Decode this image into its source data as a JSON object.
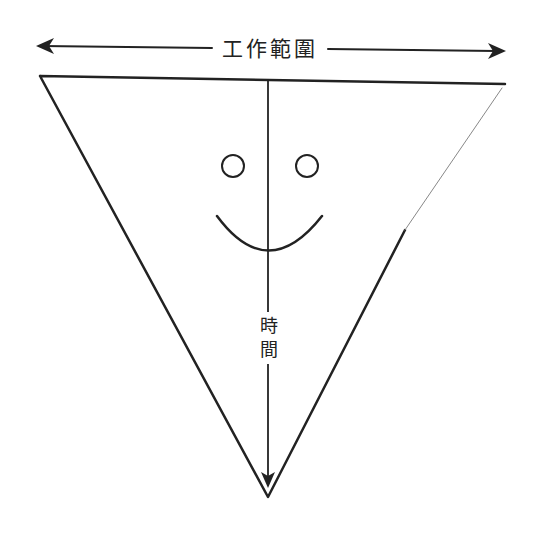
{
  "diagram": {
    "type": "inverted-triangle",
    "scope_axis": {
      "label": "工作範圍",
      "direction": "bidirectional-horizontal"
    },
    "time_axis": {
      "label_line1": "時",
      "label_line2": "間",
      "direction": "downward"
    },
    "face": {
      "expression": "smile",
      "parts": [
        "left-eye",
        "right-eye",
        "mouth"
      ]
    },
    "stroke_color": "#222222",
    "background_color": "#ffffff"
  }
}
